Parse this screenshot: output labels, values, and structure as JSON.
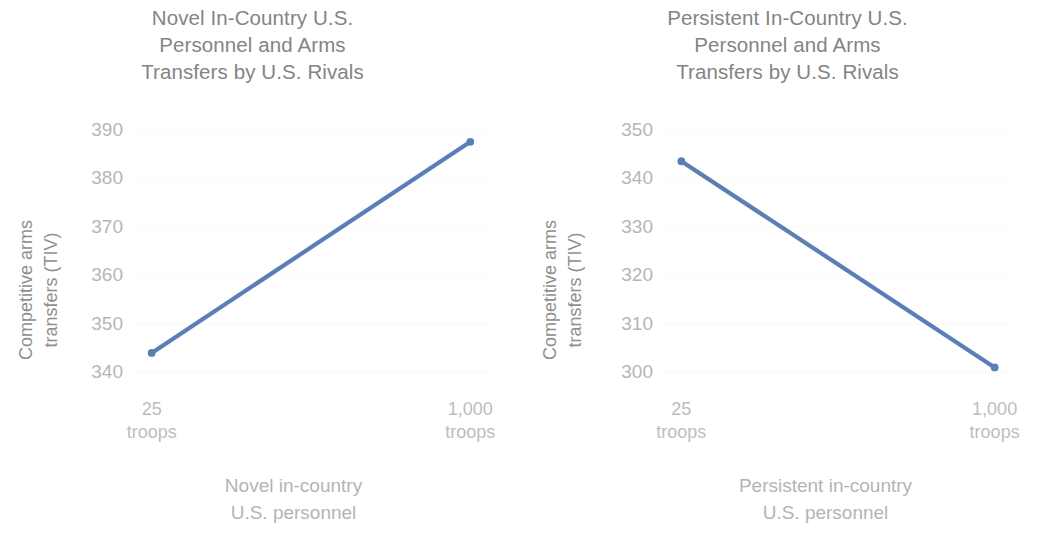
{
  "chart_data": [
    {
      "type": "line",
      "panel": "left",
      "title": "Novel In-Country U.S.\nPersonnel and Arms\nTransfers by U.S. Rivals",
      "xlabel": "Novel in-country\nU.S. personnel",
      "ylabel": "Competitive arms\ntransfers (TIV)",
      "categories": [
        "25\ntroops",
        "1,000\ntroops"
      ],
      "x": [
        25,
        1000
      ],
      "values": [
        344.0,
        387.5
      ],
      "yticks": [
        340,
        350,
        360,
        370,
        380,
        390
      ],
      "ylim": [
        338,
        392
      ],
      "grid": true,
      "legend": "none",
      "line_color": "#5b7fb5",
      "marker_color": "#5b7fb5"
    },
    {
      "type": "line",
      "panel": "right",
      "title": "Persistent In-Country U.S.\nPersonnel and Arms\nTransfers by U.S. Rivals",
      "xlabel": "Persistent in-country\nU.S. personnel",
      "ylabel": "Competitive arms\ntransfers (TIV)",
      "categories": [
        "25\ntroops",
        "1,000\ntroops"
      ],
      "x": [
        25,
        1000
      ],
      "values": [
        343.5,
        301.0
      ],
      "yticks": [
        300,
        310,
        320,
        330,
        340,
        350
      ],
      "ylim": [
        298,
        352
      ],
      "grid": true,
      "legend": "none",
      "line_color": "#5b7fb5",
      "marker_color": "#5b7fb5"
    }
  ],
  "colors": {
    "line": "#5b7fb5",
    "title_text": "#848484",
    "axis_label_text": "#b4b4b4",
    "tick_text": "#b6b6b6",
    "gridline": "#fafafb",
    "background": "#ffffff"
  }
}
